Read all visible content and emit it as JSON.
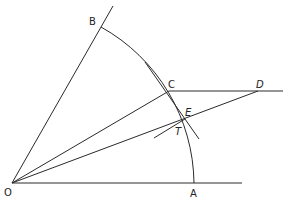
{
  "diagram": {
    "labels": {
      "O": "O",
      "A": "A",
      "B": "B",
      "C": "C",
      "D": "D",
      "E": "E",
      "T": "T"
    },
    "points": {
      "O": [
        12,
        183
      ],
      "A": [
        194,
        183
      ],
      "B": [
        101,
        27
      ],
      "C": [
        169,
        91
      ],
      "D": [
        258,
        91
      ],
      "E": [
        183,
        119
      ],
      "T": [
        183,
        121
      ]
    },
    "stroke_color": "#2a2a2a",
    "background": "#ffffff"
  }
}
